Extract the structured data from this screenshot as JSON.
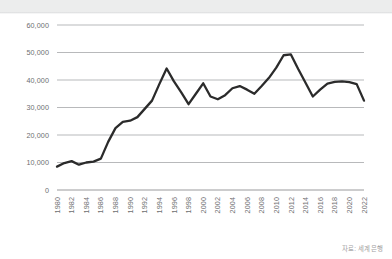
{
  "figure": {
    "source_note": "자료: 세계은행"
  },
  "chart_data": {
    "type": "line",
    "title": "",
    "subtitle": "",
    "xlabel": "",
    "ylabel": "",
    "grid": true,
    "legend": null,
    "xlim": [
      1980,
      2022
    ],
    "ylim": [
      0,
      60000
    ],
    "ytick_labels": [
      "60,000",
      "50,000",
      "40,000",
      "30,000",
      "20,000",
      "10,000",
      "0"
    ],
    "ytick_values": [
      60000,
      50000,
      40000,
      30000,
      20000,
      10000,
      0
    ],
    "xtick_labels": [
      "1980",
      "1982",
      "1984",
      "1986",
      "1988",
      "1990",
      "1992",
      "1994",
      "1996",
      "1998",
      "2000",
      "2002",
      "2004",
      "2006",
      "2008",
      "2010",
      "2012",
      "2014",
      "2016",
      "2018",
      "2020",
      "2022"
    ],
    "xtick_values": [
      1980,
      1982,
      1984,
      1986,
      1988,
      1990,
      1992,
      1994,
      1996,
      1998,
      2000,
      2002,
      2004,
      2006,
      2008,
      2010,
      2012,
      2014,
      2016,
      2018,
      2020,
      2022
    ],
    "series": [
      {
        "name": "series-1",
        "color": "#2b2b2b",
        "x": [
          1980,
          1981,
          1982,
          1983,
          1984,
          1985,
          1986,
          1987,
          1988,
          1989,
          1990,
          1991,
          1992,
          1993,
          1994,
          1995,
          1996,
          1997,
          1998,
          1999,
          2000,
          2001,
          2002,
          2003,
          2004,
          2005,
          2006,
          2007,
          2008,
          2009,
          2010,
          2011,
          2012,
          2013,
          2014,
          2015,
          2016,
          2017,
          2018,
          2019,
          2020,
          2021,
          2022
        ],
        "values": [
          8500,
          9800,
          10500,
          9200,
          10000,
          10300,
          11400,
          17500,
          22500,
          24800,
          25200,
          26500,
          29500,
          32500,
          38500,
          44200,
          39500,
          35500,
          31200,
          35000,
          38800,
          34000,
          33000,
          34500,
          37000,
          37800,
          36500,
          35000,
          37800,
          40800,
          44500,
          49000,
          49300,
          44000,
          39000,
          34000,
          36500,
          38700,
          39300,
          39500,
          39200,
          38500,
          32500
        ]
      }
    ]
  }
}
